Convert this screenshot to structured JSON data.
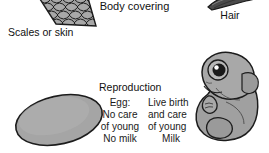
{
  "figure": {
    "body_covering": {
      "heading": "Body covering",
      "left_label": "Scales or skin",
      "right_label": "Hair",
      "left_icon": "fish-scales-illustration",
      "right_icon": "hair-tuft-illustration"
    },
    "reproduction": {
      "heading": "Reproduction",
      "left_icon": "egg-illustration",
      "right_icon": "fetus-illustration",
      "egg_column": [
        "Egg:",
        "No care",
        "of young",
        "No milk"
      ],
      "live_birth_column": [
        "Live birth",
        "and care",
        "of young",
        "Milk"
      ]
    }
  },
  "colors": {
    "ink": "#111111",
    "fill_gray": "#9d9d9d",
    "fill_gray_light": "#b5b5b5",
    "outline": "#1c1c1c",
    "background": "#ffffff",
    "hair_dark": "#3a3a3a"
  }
}
